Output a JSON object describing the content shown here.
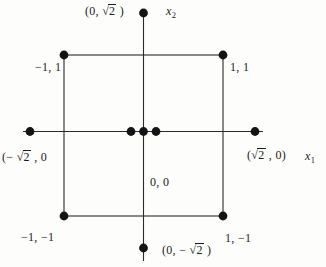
{
  "figure": {
    "radical_sign": "√",
    "axes": {
      "x1": {
        "base": "x",
        "sub": "1"
      },
      "x2": {
        "base": "x",
        "sub": "2"
      }
    },
    "labels": {
      "top": {
        "before": "(0, ",
        "root": "2",
        "after": " )"
      },
      "bottom": {
        "before": "(0, − ",
        "root": "2",
        "after": " )"
      },
      "left": {
        "before": "(− ",
        "root": "2",
        "after": " , 0"
      },
      "right": {
        "before": "(",
        "root": "2",
        "after": " , 0)"
      },
      "top_left": "−1, 1",
      "top_right": "1, 1",
      "bottom_left": "−1, −1",
      "bottom_right": "1, −1",
      "origin": "0, 0"
    },
    "colors": {
      "ink": "#1b1b1b",
      "line": "#2b2b2b",
      "paper": "#fdfdfb"
    }
  }
}
